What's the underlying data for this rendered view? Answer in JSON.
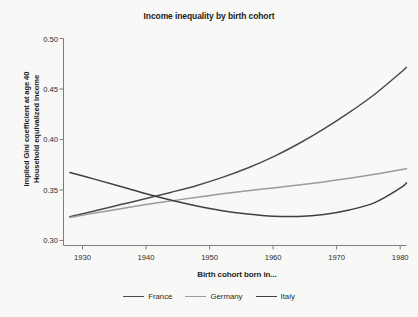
{
  "chart_data": {
    "type": "line",
    "title": "Income inequality by birth cohort",
    "xlabel": "Birth cohort born in...",
    "ylabel": "Implied Gini coefficient at age 40",
    "ylabel_line2": "Household equivalized income",
    "xlim": [
      1927,
      1981
    ],
    "ylim": [
      0.295,
      0.5
    ],
    "xticks": [
      1930,
      1940,
      1950,
      1960,
      1970,
      1980
    ],
    "xtick_labels": [
      "1930",
      "1940",
      "1950",
      "1960",
      "1970",
      "1980"
    ],
    "yticks": [
      0.3,
      0.35,
      0.4,
      0.45,
      0.5
    ],
    "ytick_labels": [
      "0.30",
      "0.35",
      "0.40",
      "0.45",
      "0.50"
    ],
    "grid": false,
    "legend_position": "bottom",
    "x": [
      1928,
      1932,
      1936,
      1940,
      1944,
      1948,
      1952,
      1956,
      1960,
      1964,
      1968,
      1972,
      1976,
      1980,
      1981
    ],
    "series": [
      {
        "name": "France",
        "color": "#4b4b4b",
        "values": [
          0.3235,
          0.3295,
          0.3355,
          0.3415,
          0.3478,
          0.3545,
          0.3625,
          0.3718,
          0.3828,
          0.3958,
          0.4105,
          0.4268,
          0.4448,
          0.4658,
          0.4715
        ]
      },
      {
        "name": "Germany",
        "color": "#9b9b9b",
        "values": [
          0.3228,
          0.3272,
          0.3315,
          0.3355,
          0.3392,
          0.3428,
          0.3462,
          0.3492,
          0.352,
          0.3548,
          0.358,
          0.3615,
          0.3655,
          0.37,
          0.3712
        ]
      },
      {
        "name": "Italy",
        "color": "#3f3f3f",
        "values": [
          0.3672,
          0.3605,
          0.3535,
          0.3462,
          0.3398,
          0.3342,
          0.3295,
          0.3262,
          0.324,
          0.3238,
          0.3258,
          0.3302,
          0.3375,
          0.3518,
          0.357
        ]
      }
    ],
    "annotations": []
  },
  "legend": {
    "items": [
      {
        "label": "France",
        "color": "#4b4b4b"
      },
      {
        "label": "Germany",
        "color": "#9b9b9b"
      },
      {
        "label": "Italy",
        "color": "#3f3f3f"
      }
    ]
  },
  "colors": {
    "background": "#f8f8f6",
    "axis": "#7d7d7d",
    "text": "#1d1d1d"
  }
}
